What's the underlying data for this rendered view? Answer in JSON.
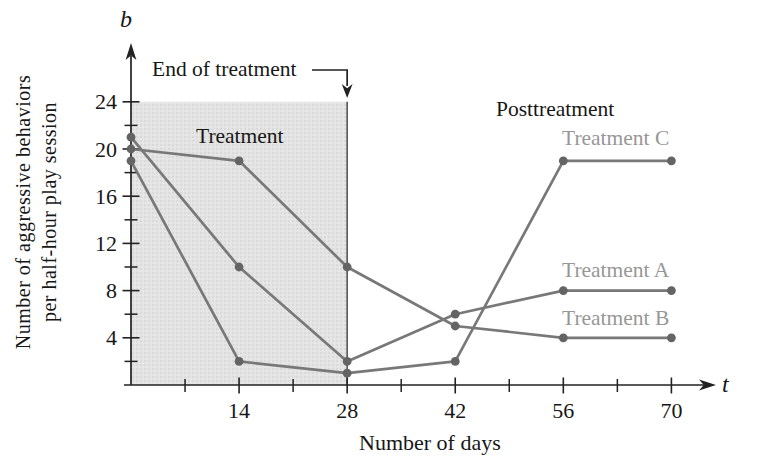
{
  "figure": {
    "y_var": "b",
    "x_var": "t",
    "y_axis_label_line1": "Number of aggressive behaviors",
    "y_axis_label_line2": "per half-hour play session",
    "x_axis_title": "Number of days",
    "region_label": "Treatment",
    "post_label": "Posttreatment",
    "end_annotation": "End of treatment"
  },
  "chart_data": {
    "type": "line",
    "x": [
      0,
      14,
      28,
      42,
      56,
      70
    ],
    "series": [
      {
        "name": "Treatment A",
        "values": [
          21,
          10,
          2,
          6,
          8,
          8
        ]
      },
      {
        "name": "Treatment B",
        "values": [
          20,
          19,
          10,
          5,
          4,
          4
        ]
      },
      {
        "name": "Treatment C",
        "values": [
          19,
          2,
          1,
          2,
          19,
          19
        ]
      }
    ],
    "x_ticks_labeled": [
      14,
      28,
      42,
      56,
      70
    ],
    "x_ticks_minor": [
      7,
      21,
      35,
      49,
      63
    ],
    "y_ticks_labeled": [
      4,
      8,
      12,
      16,
      20,
      24
    ],
    "y_ticks_minor": [
      2,
      6,
      10,
      14,
      18,
      22
    ],
    "xlim": [
      0,
      74
    ],
    "ylim": [
      0,
      27
    ],
    "grid": false,
    "legend_position": "inline-right",
    "treatment_region": {
      "x_start": 0,
      "x_end": 28,
      "y_top": 24
    },
    "colors": {
      "line": "#787878",
      "marker": "#646464",
      "series_label": "#979797",
      "axis": "#222222",
      "text": "#171717",
      "region_fill": "#e4e4e4",
      "region_dot": "#cdcdcd"
    }
  }
}
